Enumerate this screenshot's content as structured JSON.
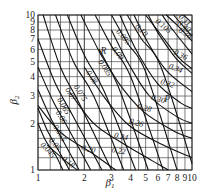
{
  "chart_data": {
    "type": "line",
    "title": "",
    "xlabel": "β1",
    "ylabel": "β2",
    "xscale": "log",
    "yscale": "log",
    "xlim": [
      1,
      10
    ],
    "ylim": [
      1,
      10
    ],
    "grid": true,
    "x_ticks": [
      "1",
      "2",
      "3",
      "4",
      "5",
      "6",
      "7",
      "8",
      "9",
      "10"
    ],
    "y_ticks": [
      "1",
      "2",
      "3",
      "4",
      "5",
      "6",
      "7",
      "8",
      "9",
      "10"
    ],
    "annotations": [
      {
        "text": "R",
        "x": 2.55,
        "y": 5.6
      },
      {
        "text": "P",
        "x": 6.6,
        "y": 2.75
      }
    ],
    "series": [
      {
        "name": "0.045",
        "family": "R",
        "points": [
          [
            1.0,
            2.0
          ],
          [
            1.12,
            1.55
          ],
          [
            1.3,
            1.25
          ],
          [
            1.45,
            1.0
          ]
        ]
      },
      {
        "name": "0.05",
        "family": "R",
        "points": [
          [
            1.0,
            2.5
          ],
          [
            1.15,
            1.8
          ],
          [
            1.35,
            1.35
          ],
          [
            1.6,
            1.0
          ]
        ]
      },
      {
        "name": "0.055",
        "family": "R",
        "points": [
          [
            1.0,
            3.3
          ],
          [
            1.2,
            2.2
          ],
          [
            1.45,
            1.55
          ],
          [
            1.85,
            1.0
          ]
        ]
      },
      {
        "name": "0.06",
        "family": "R",
        "points": [
          [
            1.0,
            4.6
          ],
          [
            1.25,
            2.8
          ],
          [
            1.55,
            1.9
          ],
          [
            2.2,
            1.0
          ]
        ]
      },
      {
        "name": "0.065",
        "family": "R",
        "points": [
          [
            1.0,
            7.0
          ],
          [
            1.3,
            3.6
          ],
          [
            1.7,
            2.2
          ],
          [
            2.6,
            1.0
          ]
        ]
      },
      {
        "name": "0.07",
        "family": "R",
        "points": [
          [
            1.08,
            10.0
          ],
          [
            1.4,
            4.6
          ],
          [
            1.85,
            2.7
          ],
          [
            3.0,
            1.0
          ]
        ]
      },
      {
        "name": "0.075",
        "family": "R",
        "points": [
          [
            1.3,
            10.0
          ],
          [
            1.7,
            5.0
          ],
          [
            2.3,
            3.0
          ],
          [
            3.6,
            1.0
          ]
        ]
      },
      {
        "name": "0.08",
        "family": "R",
        "points": [
          [
            1.55,
            10.0
          ],
          [
            2.0,
            5.5
          ],
          [
            2.7,
            3.2
          ],
          [
            4.3,
            1.0
          ]
        ]
      },
      {
        "name": "0.085",
        "family": "R",
        "points": [
          [
            1.9,
            10.0
          ],
          [
            2.5,
            5.8
          ],
          [
            3.3,
            3.5
          ],
          [
            5.2,
            1.0
          ]
        ]
      },
      {
        "name": "0.09",
        "family": "R",
        "points": [
          [
            2.35,
            10.0
          ],
          [
            3.0,
            6.3
          ],
          [
            4.0,
            4.0
          ],
          [
            6.5,
            1.0
          ]
        ]
      },
      {
        "name": "0.095",
        "family": "R",
        "points": [
          [
            3.0,
            10.0
          ],
          [
            3.8,
            6.6
          ],
          [
            5.0,
            4.3
          ],
          [
            8.0,
            1.0
          ]
        ]
      },
      {
        "name": "0.10",
        "family": "R",
        "points": [
          [
            3.8,
            10.0
          ],
          [
            4.7,
            7.0
          ],
          [
            6.3,
            4.6
          ],
          [
            10.0,
            1.1
          ]
        ]
      },
      {
        "name": "0.105",
        "family": "R",
        "points": [
          [
            5.0,
            10.0
          ],
          [
            6.2,
            7.6
          ],
          [
            8.2,
            5.3
          ],
          [
            10.0,
            4.5
          ]
        ]
      },
      {
        "name": "0.11",
        "family": "R",
        "points": [
          [
            6.8,
            10.0
          ],
          [
            8.0,
            8.6
          ],
          [
            10.0,
            6.8
          ]
        ]
      },
      {
        "name": "0.18",
        "family": "P",
        "points": [
          [
            1.15,
            1.45
          ],
          [
            1.5,
            1.15
          ],
          [
            1.8,
            1.0
          ]
        ]
      },
      {
        "name": "0.20",
        "family": "P",
        "points": [
          [
            1.0,
            2.6
          ],
          [
            1.4,
            1.75
          ],
          [
            2.2,
            1.3
          ],
          [
            3.2,
            1.0
          ]
        ]
      },
      {
        "name": "0.22",
        "family": "P",
        "points": [
          [
            1.6,
            3.2
          ],
          [
            2.3,
            2.0
          ],
          [
            3.5,
            1.5
          ],
          [
            5.5,
            1.15
          ],
          [
            7.0,
            1.0
          ]
        ]
      },
      {
        "name": "0.24",
        "family": "P",
        "points": [
          [
            2.0,
            4.6
          ],
          [
            2.8,
            2.8
          ],
          [
            4.0,
            1.9
          ],
          [
            6.5,
            1.45
          ],
          [
            10.0,
            1.2
          ]
        ]
      },
      {
        "name": "0.26",
        "family": "P",
        "points": [
          [
            2.5,
            6.0
          ],
          [
            3.3,
            3.7
          ],
          [
            4.8,
            2.4
          ],
          [
            7.5,
            1.8
          ],
          [
            10.0,
            1.6
          ]
        ]
      },
      {
        "name": "0.28",
        "family": "P",
        "points": [
          [
            3.0,
            8.0
          ],
          [
            3.9,
            4.8
          ],
          [
            5.3,
            3.0
          ],
          [
            8.0,
            2.2
          ],
          [
            10.0,
            2.0
          ]
        ]
      },
      {
        "name": "0.30",
        "family": "P",
        "points": [
          [
            3.4,
            10.0
          ],
          [
            4.4,
            5.8
          ],
          [
            6.0,
            3.6
          ],
          [
            8.5,
            2.7
          ],
          [
            10.0,
            2.5
          ]
        ]
      },
      {
        "name": "0.32",
        "family": "P",
        "points": [
          [
            4.2,
            10.0
          ],
          [
            5.1,
            6.8
          ],
          [
            6.8,
            4.4
          ],
          [
            10.0,
            3.2
          ]
        ]
      },
      {
        "name": "0.34",
        "family": "P",
        "points": [
          [
            5.2,
            10.0
          ],
          [
            6.0,
            7.7
          ],
          [
            7.8,
            5.3
          ],
          [
            10.0,
            4.2
          ]
        ]
      },
      {
        "name": "0.36",
        "family": "P",
        "points": [
          [
            6.4,
            10.0
          ],
          [
            7.3,
            8.3
          ],
          [
            10.0,
            5.6
          ]
        ]
      },
      {
        "name": "0.38",
        "family": "P",
        "points": [
          [
            7.6,
            10.0
          ],
          [
            10.0,
            7.3
          ]
        ]
      },
      {
        "name": "0.40",
        "family": "P",
        "points": [
          [
            8.8,
            10.0
          ],
          [
            10.0,
            8.9
          ]
        ]
      }
    ],
    "curve_labels": [
      {
        "text": "0.045",
        "x": 1.03,
        "y": 1.45,
        "rot": 48
      },
      {
        "text": "0.05",
        "x": 1.17,
        "y": 1.55,
        "rot": 48
      },
      {
        "text": "0.18",
        "x": 1.42,
        "y": 1.17,
        "rot": 40
      },
      {
        "text": "0.055",
        "x": 1.25,
        "y": 1.9,
        "rot": 58
      },
      {
        "text": "0.06",
        "x": 1.3,
        "y": 2.35,
        "rot": 58
      },
      {
        "text": "0.065",
        "x": 1.33,
        "y": 2.85,
        "rot": 60
      },
      {
        "text": "0.07",
        "x": 1.5,
        "y": 3.3,
        "rot": 58
      },
      {
        "text": "0.075",
        "x": 1.7,
        "y": 3.45,
        "rot": 58
      },
      {
        "text": "0.08",
        "x": 2.05,
        "y": 4.25,
        "rot": 58
      },
      {
        "text": "0.085",
        "x": 2.45,
        "y": 5.0,
        "rot": 56
      },
      {
        "text": "0.09",
        "x": 3.0,
        "y": 6.0,
        "rot": 52
      },
      {
        "text": "0.095",
        "x": 3.2,
        "y": 7.8,
        "rot": 50
      },
      {
        "text": "0.10",
        "x": 4.25,
        "y": 8.4,
        "rot": 46
      },
      {
        "text": "0.105",
        "x": 5.75,
        "y": 9.0,
        "rot": 40
      },
      {
        "text": "0.11",
        "x": 8.1,
        "y": 9.6,
        "rot": 42
      },
      {
        "text": "0.40",
        "x": 8.0,
        "y": 8.7,
        "rot": 36
      },
      {
        "text": "0.38",
        "x": 8.1,
        "y": 7.8,
        "rot": 32
      },
      {
        "text": "0.36",
        "x": 7.55,
        "y": 5.6,
        "rot": 26
      },
      {
        "text": "0.34",
        "x": 7.0,
        "y": 4.55,
        "rot": 22
      },
      {
        "text": "0.32",
        "x": 6.2,
        "y": 3.6,
        "rot": 18
      },
      {
        "text": "0.30",
        "x": 5.4,
        "y": 2.85,
        "rot": 16
      },
      {
        "text": "0.28",
        "x": 4.4,
        "y": 2.5,
        "rot": 16
      },
      {
        "text": "0.26",
        "x": 3.9,
        "y": 2.0,
        "rot": 16
      },
      {
        "text": "0.24",
        "x": 3.1,
        "y": 1.62,
        "rot": 12
      },
      {
        "text": "0.22",
        "x": 3.0,
        "y": 1.3,
        "rot": 8
      },
      {
        "text": "0.20",
        "x": 1.9,
        "y": 1.35,
        "rot": 14
      }
    ]
  }
}
